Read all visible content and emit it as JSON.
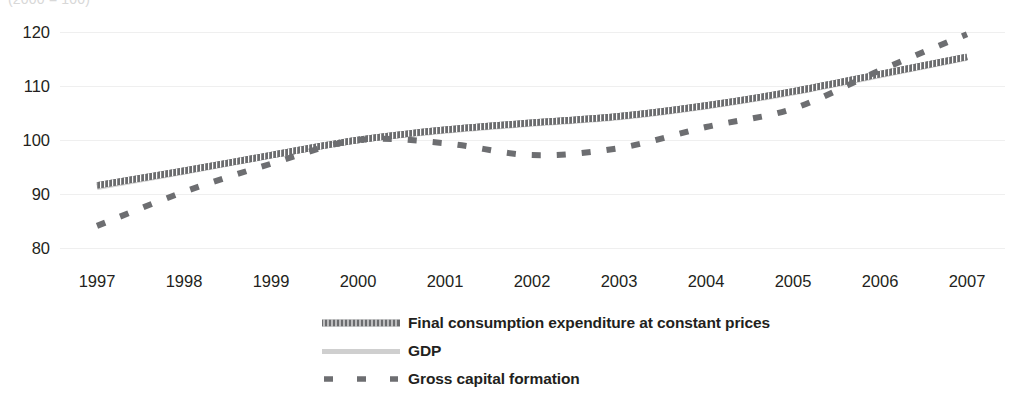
{
  "caption": "(2000 = 100)",
  "chart_data": {
    "type": "line",
    "title": "",
    "subtitle": "(2000 = 100)",
    "xlabel": "",
    "ylabel": "",
    "grid": true,
    "legend_position": "bottom",
    "x": [
      1997,
      1998,
      1999,
      2000,
      2001,
      2002,
      2003,
      2004,
      2005,
      2006,
      2007
    ],
    "xlim": [
      1997,
      2007
    ],
    "ylim": [
      78,
      122
    ],
    "yticks": [
      80,
      90,
      100,
      110,
      120
    ],
    "xtick_labels": [
      "1997",
      "1998",
      "1999",
      "2000",
      "2001",
      "2002",
      "2003",
      "2004",
      "2005",
      "2006",
      "2007"
    ],
    "series": [
      {
        "name": "Final consumption expenditure at constant prices",
        "style": "hatched-thick",
        "color": "#58595b",
        "values": [
          91.6,
          94.3,
          97.2,
          100.0,
          101.9,
          103.2,
          104.4,
          106.4,
          109.0,
          112.2,
          115.4
        ]
      },
      {
        "name": "GDP",
        "style": "solid-light",
        "color": "#d0d0d0",
        "values": [
          91.3,
          94.1,
          97.1,
          100.0,
          101.7,
          103.0,
          104.2,
          106.2,
          108.8,
          112.0,
          115.2
        ]
      },
      {
        "name": "Gross capital formation",
        "style": "dashed",
        "color": "#6d6e71",
        "values": [
          84.1,
          90.4,
          95.6,
          100.0,
          99.4,
          97.2,
          98.5,
          102.4,
          105.8,
          112.9,
          119.6
        ]
      }
    ]
  },
  "legend": {
    "items": [
      {
        "label": "Final consumption expenditure at constant prices",
        "swatch": "hatched-thick-swatch"
      },
      {
        "label": "GDP",
        "swatch": "solid-light-swatch"
      },
      {
        "label": "Gross capital formation",
        "swatch": "dashed-swatch"
      }
    ]
  }
}
